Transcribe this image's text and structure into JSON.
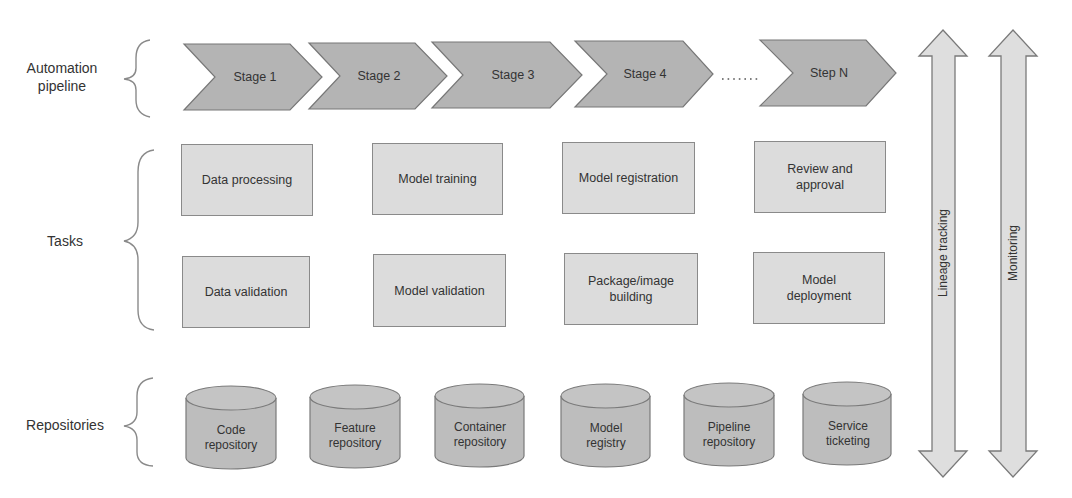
{
  "rows": {
    "pipeline": {
      "label_line1": "Automation",
      "label_line2": "pipeline"
    },
    "tasks": {
      "label": "Tasks"
    },
    "repositories": {
      "label": "Repositories"
    }
  },
  "pipeline": {
    "stages": [
      {
        "label": "Stage 1"
      },
      {
        "label": "Stage 2"
      },
      {
        "label": "Stage 3"
      },
      {
        "label": "Stage 4"
      },
      {
        "label": "Step N"
      }
    ],
    "ellipsis": "......."
  },
  "tasks": {
    "row1": [
      {
        "label": "Data processing"
      },
      {
        "label": "Model training"
      },
      {
        "label": "Model registration"
      },
      {
        "label": "Review and approval"
      }
    ],
    "row2": [
      {
        "label": "Data validation"
      },
      {
        "label": "Model validation"
      },
      {
        "label": "Package/image building"
      },
      {
        "label": "Model deployment"
      }
    ]
  },
  "repositories": [
    {
      "line1": "Code",
      "line2": "repository"
    },
    {
      "line1": "Feature",
      "line2": "repository"
    },
    {
      "line1": "Container",
      "line2": "repository"
    },
    {
      "line1": "Model",
      "line2": "registry"
    },
    {
      "line1": "Pipeline",
      "line2": "repository"
    },
    {
      "line1": "Service",
      "line2": "ticketing"
    }
  ],
  "cross_cutting": [
    {
      "label": "Lineage tracking"
    },
    {
      "label": "Monitoring"
    }
  ],
  "colors": {
    "chevron_fill": "#b4b4b4",
    "chevron_stroke": "#777777",
    "task_fill": "#dcdcdc",
    "cylinder_fill": "#bdbdbd",
    "arrow_fill": "#dedede",
    "stroke": "#7a7a7a",
    "brace": "#8a8a8a"
  }
}
